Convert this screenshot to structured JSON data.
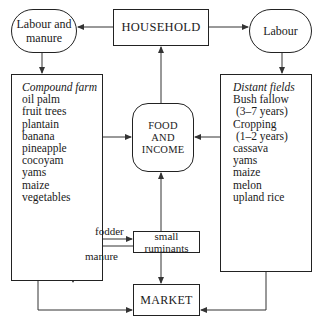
{
  "diagram": {
    "nodes": {
      "household": {
        "label": "HOUSEHOLD"
      },
      "labour_and_manure": {
        "label_line1": "Labour and",
        "label_line2": "manure"
      },
      "labour": {
        "label": "Labour"
      },
      "compound_farm": {
        "heading": "Compound farm",
        "items": [
          "oil palm",
          "fruit trees",
          "plantain",
          "banana",
          "pineapple",
          "cocoyam",
          "yams",
          "maize",
          "vegetables"
        ]
      },
      "distant_fields": {
        "heading": "Distant fields",
        "items": [
          "Bush fallow",
          " (3–7 years)",
          "Cropping",
          " (1–2 years)",
          "cassava",
          "yams",
          "maize",
          "melon",
          "upland rice"
        ]
      },
      "food_and_income": {
        "line1": "FOOD",
        "line2": "AND",
        "line3": "INCOME"
      },
      "small_ruminants": {
        "line1": "small",
        "line2": "ruminants"
      },
      "market": {
        "label": "MARKET"
      }
    },
    "edge_labels": {
      "fodder": "fodder",
      "manure": "manure"
    },
    "edges": [
      {
        "from": "household",
        "to": "labour_and_manure"
      },
      {
        "from": "household",
        "to": "labour"
      },
      {
        "from": "labour_and_manure",
        "to": "compound_farm"
      },
      {
        "from": "labour",
        "to": "distant_fields"
      },
      {
        "from": "compound_farm",
        "to": "food_and_income"
      },
      {
        "from": "distant_fields",
        "to": "food_and_income"
      },
      {
        "from": "food_and_income",
        "to": "household"
      },
      {
        "from": "small_ruminants",
        "to": "food_and_income"
      },
      {
        "from": "compound_farm",
        "to": "small_ruminants",
        "label": "fodder"
      },
      {
        "from": "small_ruminants",
        "to": "compound_farm",
        "label": "manure"
      },
      {
        "from": "small_ruminants",
        "to": "market"
      },
      {
        "from": "compound_farm",
        "to": "market"
      },
      {
        "from": "distant_fields",
        "to": "market"
      }
    ],
    "line_color": "#333333"
  }
}
